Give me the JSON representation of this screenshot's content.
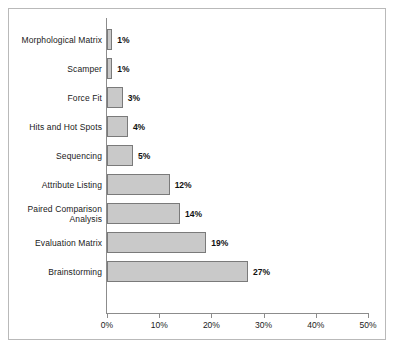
{
  "chart": {
    "background_color": "#ffffff",
    "bar_fill_color": "#c9c9c9",
    "bar_border_color": "#7a7a7a",
    "axis_color": "#8c8c8c",
    "frame_color": "#b9b9b9",
    "text_color": "#1a1a1a"
  },
  "chart_data": {
    "type": "bar",
    "orientation": "horizontal",
    "title": "",
    "xlabel": "",
    "ylabel": "",
    "categories": [
      "Morphological Matrix",
      "Scamper",
      "Force Fit",
      "Hits and Hot Spots",
      "Sequencing",
      "Attribute Listing",
      "Paired Comparison Analysis",
      "Evaluation Matrix",
      "Brainstorming"
    ],
    "values": [
      1,
      1,
      3,
      4,
      5,
      12,
      14,
      19,
      27
    ],
    "value_labels": [
      "1%",
      "1%",
      "3%",
      "4%",
      "5%",
      "12%",
      "14%",
      "19%",
      "27%"
    ],
    "xlim": [
      0,
      50
    ],
    "xticks": [
      0,
      10,
      20,
      30,
      40,
      50
    ],
    "xtick_labels": [
      "0%",
      "10%",
      "20%",
      "30%",
      "40%",
      "50%"
    ],
    "grid": false,
    "legend": false
  }
}
